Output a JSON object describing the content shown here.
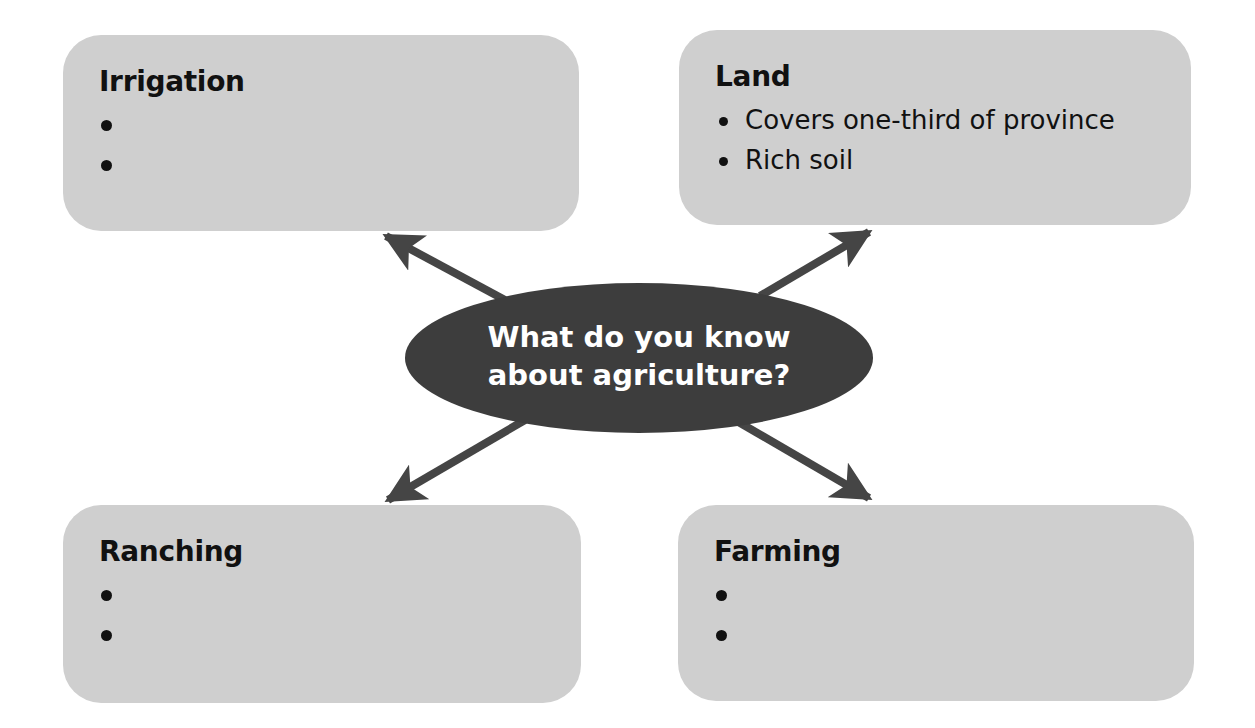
{
  "center": {
    "line1": "What do you know",
    "line2": "about agriculture?"
  },
  "boxes": {
    "irrigation": {
      "title": "Irrigation",
      "bullets": [
        "",
        ""
      ]
    },
    "land": {
      "title": "Land",
      "bullets": [
        "Covers one-third of province",
        "Rich soil"
      ]
    },
    "ranching": {
      "title": "Ranching",
      "bullets": [
        "",
        ""
      ]
    },
    "farming": {
      "title": "Farming",
      "bullets": [
        "",
        ""
      ]
    }
  },
  "colors": {
    "box_fill": "#cfcfcf",
    "ellipse_fill": "#3d3d3d",
    "arrow": "#454545",
    "text": "#111111"
  }
}
